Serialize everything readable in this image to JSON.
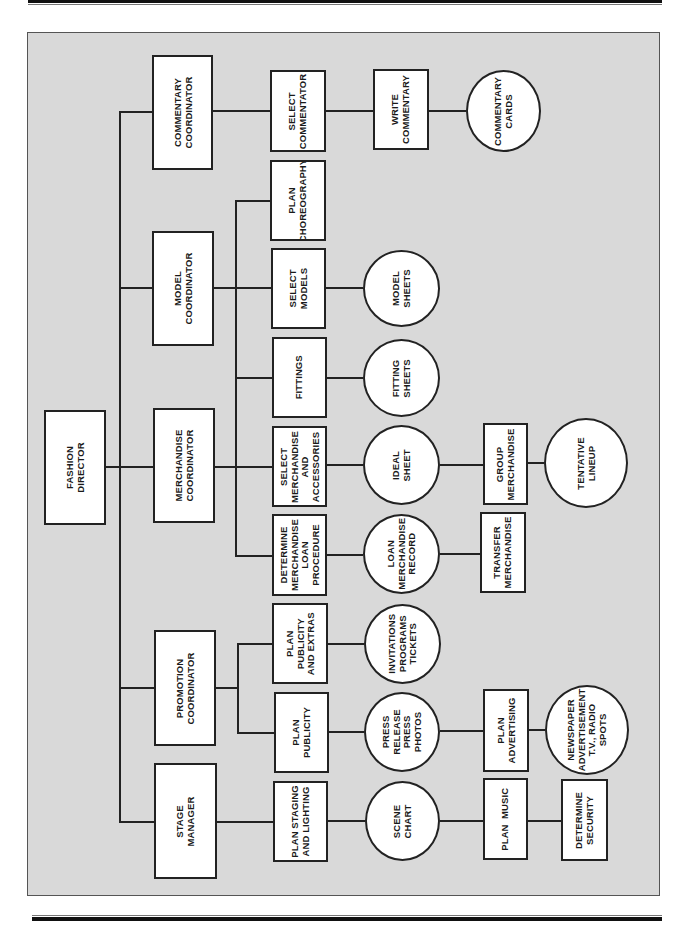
{
  "diagram": {
    "type": "organizational-flow-chart",
    "orientation": "rotated-90-ccw",
    "colors": {
      "panel": "#d9d9d9",
      "node_fill": "#ffffff",
      "line": "#222222"
    },
    "nodes": [
      {
        "id": "fashion-director",
        "label": "FASHION\nDIRECTOR",
        "shape": "box"
      },
      {
        "id": "commentary-coordinator",
        "label": "COMMENTARY\nCOORDINATOR",
        "shape": "box"
      },
      {
        "id": "model-coordinator",
        "label": "MODEL\nCOORDINATOR",
        "shape": "box"
      },
      {
        "id": "merchandise-coordinator",
        "label": "MERCHANDISE\nCOORDINATOR",
        "shape": "box"
      },
      {
        "id": "promotion-coordinator",
        "label": "PROMOTION\nCOORDINATOR",
        "shape": "box"
      },
      {
        "id": "stage-manager",
        "label": "STAGE\nMANAGER",
        "shape": "box"
      },
      {
        "id": "select-commentator",
        "label": "SELECT\nCOMMENTATOR",
        "shape": "box"
      },
      {
        "id": "write-commentary",
        "label": "WRITE\nCOMMENTARY",
        "shape": "box"
      },
      {
        "id": "commentary-cards",
        "label": "COMMENTARY\nCARDS",
        "shape": "circle"
      },
      {
        "id": "plan-choreography",
        "label": "PLAN\nCHOREOGRAPHY",
        "shape": "box"
      },
      {
        "id": "select-models",
        "label": "SELECT\nMODELS",
        "shape": "box"
      },
      {
        "id": "model-sheets",
        "label": "MODEL\nSHEETS",
        "shape": "circle"
      },
      {
        "id": "fittings",
        "label": "FITTINGS",
        "shape": "box"
      },
      {
        "id": "fitting-sheets",
        "label": "FITTING\nSHEETS",
        "shape": "circle"
      },
      {
        "id": "select-merchandise",
        "label": "SELECT\nMERCHANDISE\nAND\nACCESSORIES",
        "shape": "box"
      },
      {
        "id": "ideal-sheet",
        "label": "IDEAL\nSHEET",
        "shape": "circle"
      },
      {
        "id": "group-merchandise",
        "label": "GROUP\nMERCHANDISE",
        "shape": "box"
      },
      {
        "id": "tentative-lineup",
        "label": "TENTATIVE\nLINEUP",
        "shape": "circle"
      },
      {
        "id": "determine-loan",
        "label": "DETERMINE\nMERCHANDISE\nLOAN\nPROCEDURE",
        "shape": "box"
      },
      {
        "id": "loan-record",
        "label": "LOAN\nMERCHANDISE\nRECORD",
        "shape": "circle"
      },
      {
        "id": "transfer-merchandise",
        "label": "TRANSFER\nMERCHANDISE",
        "shape": "box"
      },
      {
        "id": "plan-publicity-extras",
        "label": "PLAN\nPUBLICITY\nAND EXTRAS",
        "shape": "box"
      },
      {
        "id": "invitations",
        "label": "INVITATIONS\nPROGRAMS\nTICKETS",
        "shape": "circle"
      },
      {
        "id": "plan-publicity",
        "label": "PLAN\nPUBLICITY",
        "shape": "box"
      },
      {
        "id": "press-release",
        "label": "PRESS\nRELEASE\nPRESS\nPHOTOS",
        "shape": "circle"
      },
      {
        "id": "plan-advertising",
        "label": "PLAN\nADVERTISING",
        "shape": "box"
      },
      {
        "id": "newspaper",
        "label": "NEWSPAPER\nADVERTISEMENT\nT.V., RADIO\nSPOTS",
        "shape": "circle"
      },
      {
        "id": "plan-staging",
        "label": "PLAN STAGING\nAND LIGHTING",
        "shape": "box"
      },
      {
        "id": "scene-chart",
        "label": "SCENE\nCHART",
        "shape": "circle"
      },
      {
        "id": "plan-music",
        "label": "PLAN  MUSIC",
        "shape": "box"
      },
      {
        "id": "determine-security",
        "label": "DETERMINE\nSECURITY",
        "shape": "box"
      }
    ],
    "edges": [
      [
        "fashion-director",
        "commentary-coordinator"
      ],
      [
        "fashion-director",
        "model-coordinator"
      ],
      [
        "fashion-director",
        "merchandise-coordinator"
      ],
      [
        "fashion-director",
        "promotion-coordinator"
      ],
      [
        "fashion-director",
        "stage-manager"
      ],
      [
        "commentary-coordinator",
        "select-commentator"
      ],
      [
        "select-commentator",
        "write-commentary"
      ],
      [
        "write-commentary",
        "commentary-cards"
      ],
      [
        "model-coordinator",
        "plan-choreography"
      ],
      [
        "model-coordinator",
        "select-models"
      ],
      [
        "model-coordinator",
        "fittings"
      ],
      [
        "model-coordinator",
        "select-merchandise"
      ],
      [
        "model-coordinator",
        "determine-loan"
      ],
      [
        "merchandise-coordinator",
        "select-merchandise"
      ],
      [
        "select-models",
        "model-sheets"
      ],
      [
        "fittings",
        "fitting-sheets"
      ],
      [
        "select-merchandise",
        "ideal-sheet"
      ],
      [
        "ideal-sheet",
        "group-merchandise"
      ],
      [
        "group-merchandise",
        "tentative-lineup"
      ],
      [
        "determine-loan",
        "loan-record"
      ],
      [
        "loan-record",
        "transfer-merchandise"
      ],
      [
        "promotion-coordinator",
        "plan-publicity-extras"
      ],
      [
        "promotion-coordinator",
        "plan-publicity"
      ],
      [
        "plan-publicity-extras",
        "invitations"
      ],
      [
        "plan-publicity",
        "press-release"
      ],
      [
        "press-release",
        "plan-advertising"
      ],
      [
        "plan-advertising",
        "newspaper"
      ],
      [
        "stage-manager",
        "plan-staging"
      ],
      [
        "plan-staging",
        "scene-chart"
      ],
      [
        "scene-chart",
        "plan-music"
      ],
      [
        "plan-music",
        "determine-security"
      ]
    ]
  },
  "labels": {
    "fashion_director": "FASHION\nDIRECTOR",
    "commentary_coordinator": "COMMENTARY\nCOORDINATOR",
    "model_coordinator": "MODEL\nCOORDINATOR",
    "merchandise_coordinator": "MERCHANDISE\nCOORDINATOR",
    "promotion_coordinator": "PROMOTION\nCOORDINATOR",
    "stage_manager": "STAGE\nMANAGER",
    "select_commentator": "SELECT\nCOMMENTATOR",
    "write_commentary": "WRITE\nCOMMENTARY",
    "commentary_cards": "COMMENTARY\nCARDS",
    "plan_choreography": "PLAN\nCHOREOGRAPHY",
    "select_models": "SELECT\nMODELS",
    "model_sheets": "MODEL\nSHEETS",
    "fittings": "FITTINGS",
    "fitting_sheets": "FITTING\nSHEETS",
    "select_merchandise": "SELECT\nMERCHANDISE\nAND\nACCESSORIES",
    "ideal_sheet": "IDEAL\nSHEET",
    "group_merchandise": "GROUP\nMERCHANDISE",
    "tentative_lineup": "TENTATIVE\nLINEUP",
    "determine_loan": "DETERMINE\nMERCHANDISE\nLOAN\nPROCEDURE",
    "loan_record": "LOAN\nMERCHANDISE\nRECORD",
    "transfer_merchandise": "TRANSFER\nMERCHANDISE",
    "plan_publicity_extras": "PLAN\nPUBLICITY\nAND EXTRAS",
    "invitations": "INVITATIONS\nPROGRAMS\nTICKETS",
    "plan_publicity": "PLAN\nPUBLICITY",
    "press_release": "PRESS\nRELEASE\nPRESS\nPHOTOS",
    "plan_advertising": "PLAN\nADVERTISING",
    "newspaper": "NEWSPAPER\nADVERTISEMENT\nT.V., RADIO\nSPOTS",
    "plan_staging": "PLAN STAGING\nAND LIGHTING",
    "scene_chart": "SCENE\nCHART",
    "plan_music": "PLAN  MUSIC",
    "determine_security": "DETERMINE\nSECURITY"
  }
}
